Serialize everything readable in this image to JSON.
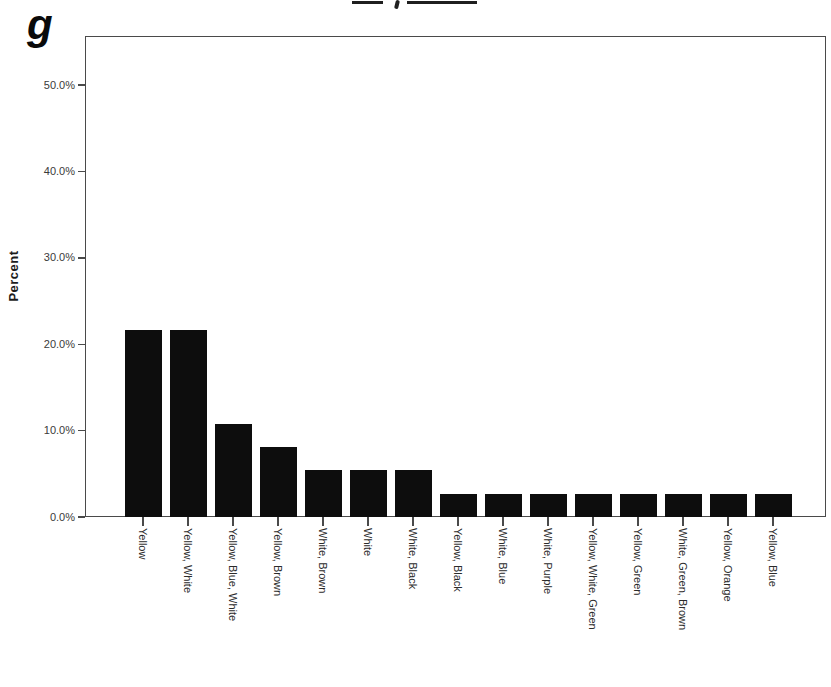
{
  "figure": {
    "label": "g"
  },
  "chart_data": {
    "type": "bar",
    "title": "",
    "xlabel": "",
    "ylabel": "Percent",
    "categories": [
      "Yellow",
      "Yellow, White",
      "Yellow, Blue, White",
      "Yellow, Brown",
      "White, Brown",
      "White",
      "White, Black",
      "Yellow, Black",
      "White, Blue",
      "White, Purple",
      "Yellow, White, Green",
      "Yellow, Green",
      "White, Green, Brown",
      "Yellow, Orange",
      "Yellow, Blue"
    ],
    "values": [
      21.6,
      21.6,
      10.8,
      8.1,
      5.4,
      5.4,
      5.4,
      2.7,
      2.7,
      2.7,
      2.7,
      2.7,
      2.7,
      2.7,
      2.7
    ],
    "value_unit": "%",
    "ytick_labels": [
      "0.0%",
      "10.0%",
      "20.0%",
      "30.0%",
      "40.0%",
      "50.0%"
    ],
    "ytick_values": [
      0,
      10,
      20,
      30,
      40,
      50
    ],
    "ylim": [
      0,
      55.7
    ],
    "grid": false,
    "legend": null,
    "bar_color": "#0d0d0d",
    "axis_color": "#4a4a4a"
  }
}
